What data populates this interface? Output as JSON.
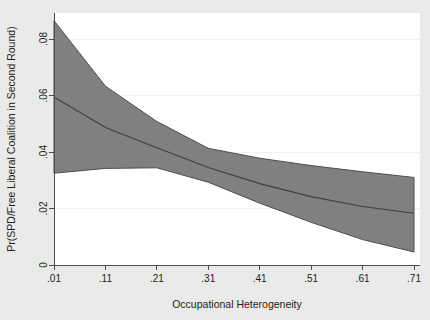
{
  "chart_data": {
    "type": "area",
    "title": "",
    "subtitle": "",
    "xlabel": "Occupational Heterogeneity",
    "ylabel": "Pr(SPD/Free Liberal Coalition in Second Round)",
    "xlim": [
      0.01,
      0.71
    ],
    "ylim": [
      0,
      0.09
    ],
    "xticks": [
      0.01,
      0.11,
      0.21,
      0.31,
      0.41,
      0.51,
      0.61,
      0.71
    ],
    "xticklabels": [
      ".01",
      ".11",
      ".21",
      ".31",
      ".41",
      ".51",
      ".61",
      ".71"
    ],
    "yticks": [
      0,
      0.02,
      0.04,
      0.06,
      0.08
    ],
    "yticklabels": [
      "0",
      ".02",
      ".04",
      ".06",
      ".08"
    ],
    "grid": false,
    "legend": "none",
    "x": [
      0.01,
      0.11,
      0.21,
      0.31,
      0.41,
      0.51,
      0.61,
      0.71
    ],
    "series": [
      {
        "name": "Predicted probability",
        "role": "center-line",
        "values": [
          0.0595,
          0.0487,
          0.0415,
          0.0345,
          0.0288,
          0.0242,
          0.0207,
          0.0183
        ]
      },
      {
        "name": "Upper 95% confidence bound",
        "role": "band-upper",
        "values": [
          0.0865,
          0.0633,
          0.0508,
          0.0413,
          0.0378,
          0.0352,
          0.033,
          0.031
        ]
      },
      {
        "name": "Lower 95% confidence bound",
        "role": "band-lower",
        "values": [
          0.0325,
          0.0342,
          0.0344,
          0.0293,
          0.0219,
          0.0151,
          0.009,
          0.0046
        ]
      }
    ],
    "colors": {
      "band_fill": "#808080",
      "band_outline": "#4d4d4d",
      "center_line": "#3f3f3f",
      "axis": "#4d4d4d",
      "plot_background": "#ffffff",
      "figure_background": "#eaeae8",
      "text": "#1d1d1d"
    }
  }
}
